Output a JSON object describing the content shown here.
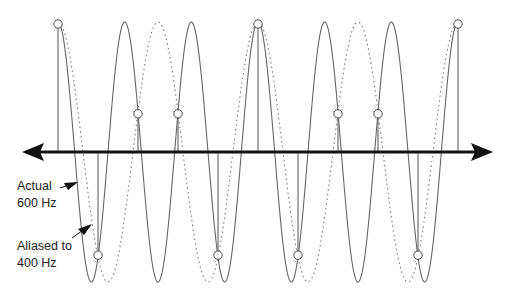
{
  "diagram": {
    "title": "",
    "labels": {
      "actual": "Actual\n600 Hz",
      "aliased": "Aliased to\n400 Hz"
    },
    "sampling": {
      "sample_rate_hz": 1000,
      "sample_count": 11
    },
    "signals": [
      {
        "name": "Actual",
        "frequency_hz": 600,
        "style": "solid"
      },
      {
        "name": "Aliased",
        "frequency_hz": 400,
        "style": "dotted"
      }
    ],
    "colors": {
      "solid_wave": "#666666",
      "dotted_wave": "#777777",
      "axis": "#111111",
      "sample_marker_fill": "#ffffff",
      "sample_marker_stroke": "#444444"
    }
  }
}
